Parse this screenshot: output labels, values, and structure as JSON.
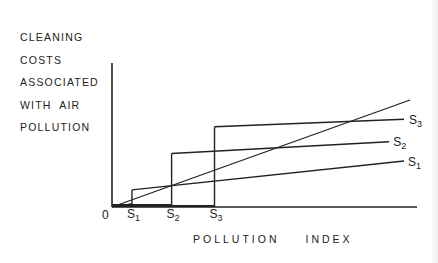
{
  "diagram": {
    "y_axis_label_lines": [
      "CLEANING",
      "COSTS",
      "ASSOCIATED",
      "WITH  AIR",
      "POLLUTION"
    ],
    "x_axis_label_words": [
      "POLLUTION",
      "INDEX"
    ],
    "origin_label": "0",
    "x_ticks": [
      {
        "id": "S1",
        "letter": "S",
        "sub": "1"
      },
      {
        "id": "S2",
        "letter": "S",
        "sub": "2"
      },
      {
        "id": "S3",
        "letter": "S",
        "sub": "3"
      }
    ],
    "curve_labels": [
      {
        "id": "S3",
        "letter": "S",
        "sub": "3"
      },
      {
        "id": "S2",
        "letter": "S",
        "sub": "2"
      },
      {
        "id": "S1",
        "letter": "S",
        "sub": "1"
      }
    ],
    "line_color": "#222222"
  },
  "chart_data": {
    "type": "line",
    "title": "",
    "xlabel": "POLLUTION INDEX",
    "ylabel": "CLEANING COSTS ASSOCIATED WITH AIR POLLUTION",
    "x_tick_labels": [
      "0",
      "S1",
      "S2",
      "S3"
    ],
    "grid": false,
    "series": [
      {
        "name": "diagonal",
        "points": [
          [
            0,
            0
          ],
          [
            1.0,
            1.0
          ]
        ]
      },
      {
        "name": "S1",
        "step_at": 0.067,
        "points": [
          [
            0.067,
            0.16
          ],
          [
            0.98,
            0.43
          ]
        ]
      },
      {
        "name": "S2",
        "step_at": 0.2,
        "points": [
          [
            0.2,
            0.5
          ],
          [
            0.93,
            0.61
          ]
        ]
      },
      {
        "name": "S3",
        "step_at": 0.344,
        "points": [
          [
            0.344,
            0.75
          ],
          [
            0.98,
            0.82
          ]
        ]
      }
    ],
    "xlim": [
      0,
      1.02
    ],
    "ylim": [
      0,
      1.35
    ]
  }
}
